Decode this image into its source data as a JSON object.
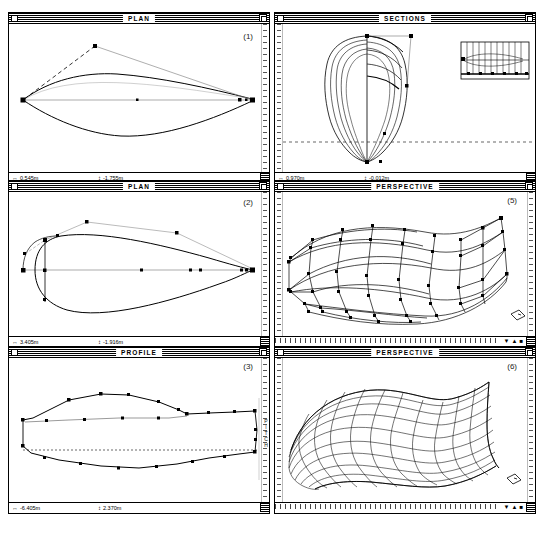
{
  "app": {
    "name": "Marine hull design CAD",
    "platform": "classic-mac-os"
  },
  "windows": [
    {
      "id": "plan-1",
      "title": "PLAN",
      "figure_label": "(1)",
      "status": {
        "x_icon": "↔",
        "x_value": "0.545m",
        "y_icon": "↕",
        "y_value": "-1.755m"
      },
      "view_type": "plan",
      "description": "Hull plan outline with two control-point handles"
    },
    {
      "id": "sections-4",
      "title": "SECTIONS",
      "figure_label": "(4)",
      "status": {
        "x_icon": "↔",
        "x_value": "0.970m",
        "y_icon": "↕",
        "y_value": "-0.012m"
      },
      "view_type": "sections",
      "description": "Body plan station sections with inset station layout"
    },
    {
      "id": "plan-2",
      "title": "PLAN",
      "figure_label": "(2)",
      "status": {
        "x_icon": "↔",
        "x_value": "3.405m",
        "y_icon": "↕",
        "y_value": "-1.916m"
      },
      "view_type": "plan",
      "description": "Refined hull plan with additional control points"
    },
    {
      "id": "perspective-5",
      "title": "PERSPECTIVE",
      "figure_label": "(5)",
      "view_type": "perspective",
      "description": "Control-net wireframe of the hull surface"
    },
    {
      "id": "profile-3",
      "title": "PROFILE",
      "figure_label": "(3)",
      "status": {
        "x_icon": "↔",
        "x_value": "-6.405m",
        "y_icon": "↕",
        "y_value": "2.370m"
      },
      "view_type": "profile",
      "description": "Hull sheer profile side view with waterline"
    },
    {
      "id": "perspective-6",
      "title": "PERSPECTIVE",
      "figure_label": "(6)",
      "view_type": "perspective",
      "description": "Rendered NURBS surface mesh of the finished hull"
    }
  ],
  "toolbar": {
    "vertical_label": "PITCH"
  },
  "colors": {
    "line": "#000000",
    "background": "#ffffff",
    "guide": "#777777",
    "titlebar_stripe": "#000000"
  }
}
